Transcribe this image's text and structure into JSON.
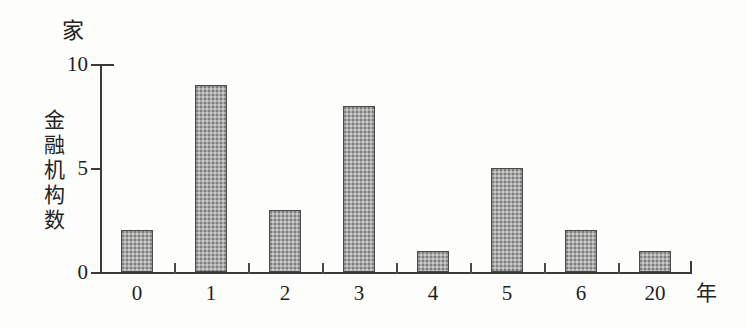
{
  "chart_data": {
    "type": "bar",
    "title": "",
    "categories": [
      "0",
      "1",
      "2",
      "3",
      "4",
      "5",
      "6",
      "20"
    ],
    "values": [
      2,
      9,
      3,
      8,
      1,
      5,
      2,
      1
    ],
    "xlabel": "年",
    "ylabel": "金融机构数",
    "y_unit": "家",
    "ylim": [
      0,
      10
    ],
    "yticks": [
      0,
      5,
      10
    ],
    "ytick_labels": [
      "0",
      "5",
      "10"
    ],
    "grid": false,
    "legend": false,
    "bar_fill": "#a9a9a9",
    "bar_border": "#4a4a4a",
    "axis_color": "#3a3a3a",
    "background": "#fdfdfc"
  },
  "axes": {
    "y_unit_caption": "家",
    "y_title_chars": [
      "金",
      "融",
      "机",
      "构",
      "数"
    ],
    "x_unit_caption": "年"
  }
}
